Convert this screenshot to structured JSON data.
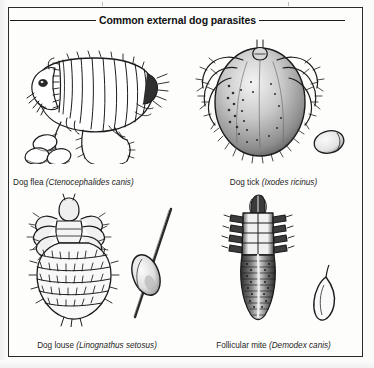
{
  "figure": {
    "title": "Common external dog parasites",
    "panels": [
      {
        "id": "dog-flea",
        "common_name": "Dog flea",
        "scientific_name": "(Ctenocephalides canis)",
        "caption": "Dog flea (Ctenocephalides canis)",
        "illustration": "flea-line-drawing",
        "egg_count": 3,
        "egg_note": "cluster of three oval eggs"
      },
      {
        "id": "dog-tick",
        "common_name": "Dog tick",
        "scientific_name": "(Ixodes ricinus)",
        "caption": "Dog tick (Ixodes ricinus)",
        "illustration": "tick-stippled-drawing",
        "egg_count": 1,
        "egg_note": "single oval egg"
      },
      {
        "id": "dog-louse",
        "common_name": "Dog louse",
        "scientific_name": "(Linognathus setosus)",
        "caption": "Dog louse (Linognathus setosus)",
        "illustration": "louse-line-drawing",
        "egg_count": 1,
        "egg_note": "nit cemented to a hair shaft"
      },
      {
        "id": "follicular-mite",
        "common_name": "Follicular mite",
        "scientific_name": "(Demodex canis)",
        "caption": "Follicular mite (Demodex canis)",
        "illustration": "demodex-mite-drawing",
        "egg_count": 1,
        "egg_note": "spindle-shaped egg"
      }
    ]
  },
  "colors": {
    "ink": "#1a1a1a",
    "frame": "#2b2b2b",
    "paper": "#fdfdfc",
    "page": "#fbfbfa"
  }
}
